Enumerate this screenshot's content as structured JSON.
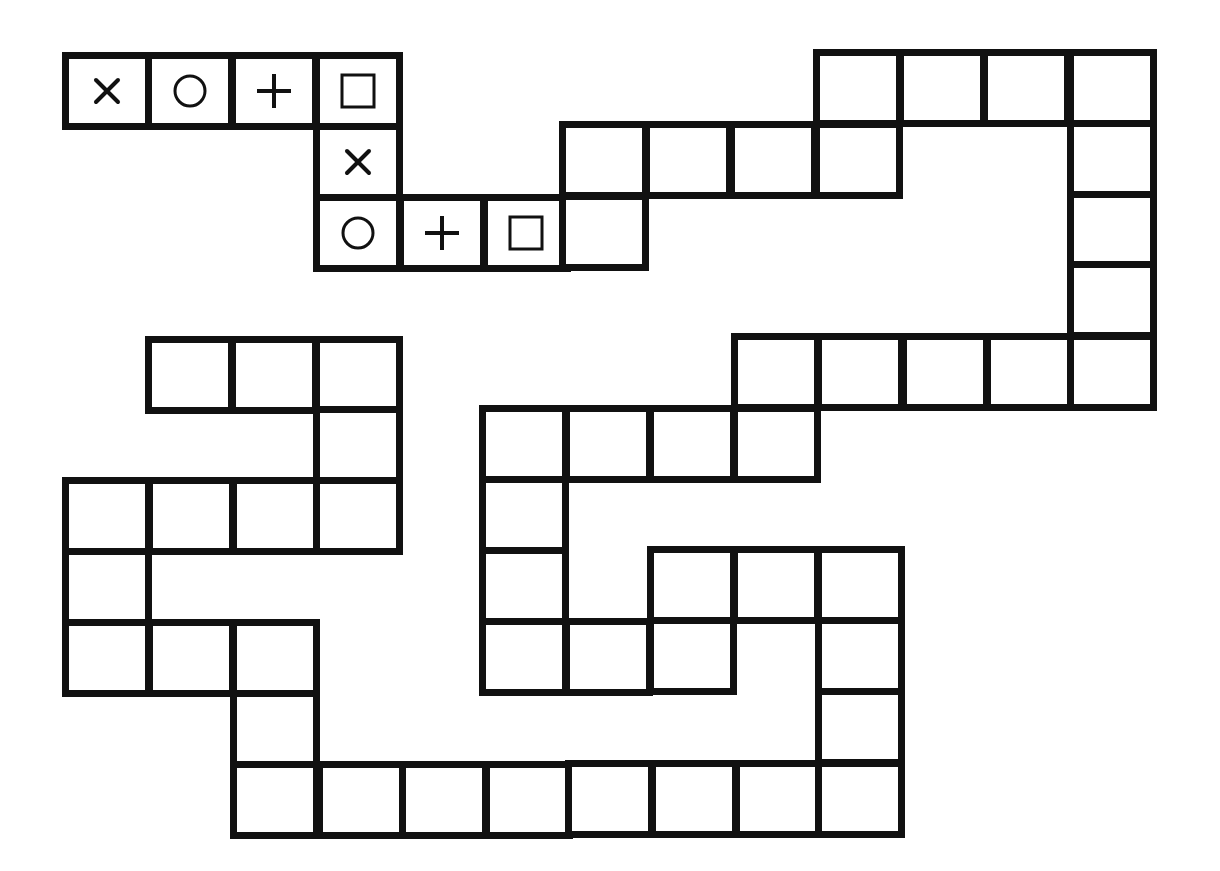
{
  "colors": {
    "line": "#111111",
    "background": "#ffffff"
  },
  "cell_size": {
    "width": 90,
    "height": 78
  },
  "symbols_legend": [
    "cross",
    "circle",
    "plus",
    "square"
  ],
  "cells": [
    {
      "x": 62,
      "y": 52,
      "symbol": "cross"
    },
    {
      "x": 145,
      "y": 52,
      "symbol": "circle"
    },
    {
      "x": 229,
      "y": 52,
      "symbol": "plus"
    },
    {
      "x": 313,
      "y": 52,
      "symbol": "square"
    },
    {
      "x": 813,
      "y": 49,
      "symbol": ""
    },
    {
      "x": 897,
      "y": 49,
      "symbol": ""
    },
    {
      "x": 981,
      "y": 49,
      "symbol": ""
    },
    {
      "x": 1067,
      "y": 49,
      "symbol": ""
    },
    {
      "x": 313,
      "y": 123,
      "symbol": "cross"
    },
    {
      "x": 559,
      "y": 121,
      "symbol": ""
    },
    {
      "x": 643,
      "y": 121,
      "symbol": ""
    },
    {
      "x": 728,
      "y": 121,
      "symbol": ""
    },
    {
      "x": 813,
      "y": 121,
      "symbol": ""
    },
    {
      "x": 1067,
      "y": 120,
      "symbol": ""
    },
    {
      "x": 313,
      "y": 194,
      "symbol": "circle"
    },
    {
      "x": 397,
      "y": 194,
      "symbol": "plus"
    },
    {
      "x": 481,
      "y": 194,
      "symbol": "square"
    },
    {
      "x": 559,
      "y": 193,
      "symbol": ""
    },
    {
      "x": 1067,
      "y": 191,
      "symbol": ""
    },
    {
      "x": 1067,
      "y": 261,
      "symbol": ""
    },
    {
      "x": 145,
      "y": 336,
      "symbol": ""
    },
    {
      "x": 229,
      "y": 336,
      "symbol": ""
    },
    {
      "x": 313,
      "y": 336,
      "symbol": ""
    },
    {
      "x": 731,
      "y": 333,
      "symbol": ""
    },
    {
      "x": 815,
      "y": 333,
      "symbol": ""
    },
    {
      "x": 900,
      "y": 333,
      "symbol": ""
    },
    {
      "x": 984,
      "y": 333,
      "symbol": ""
    },
    {
      "x": 1067,
      "y": 333,
      "symbol": ""
    },
    {
      "x": 313,
      "y": 406,
      "symbol": ""
    },
    {
      "x": 479,
      "y": 405,
      "symbol": ""
    },
    {
      "x": 563,
      "y": 405,
      "symbol": ""
    },
    {
      "x": 647,
      "y": 405,
      "symbol": ""
    },
    {
      "x": 731,
      "y": 405,
      "symbol": ""
    },
    {
      "x": 62,
      "y": 477,
      "symbol": ""
    },
    {
      "x": 146,
      "y": 477,
      "symbol": ""
    },
    {
      "x": 230,
      "y": 477,
      "symbol": ""
    },
    {
      "x": 313,
      "y": 477,
      "symbol": ""
    },
    {
      "x": 479,
      "y": 476,
      "symbol": ""
    },
    {
      "x": 62,
      "y": 548,
      "symbol": ""
    },
    {
      "x": 479,
      "y": 547,
      "symbol": ""
    },
    {
      "x": 647,
      "y": 546,
      "symbol": ""
    },
    {
      "x": 731,
      "y": 546,
      "symbol": ""
    },
    {
      "x": 815,
      "y": 546,
      "symbol": ""
    },
    {
      "x": 62,
      "y": 619,
      "symbol": ""
    },
    {
      "x": 146,
      "y": 619,
      "symbol": ""
    },
    {
      "x": 230,
      "y": 619,
      "symbol": ""
    },
    {
      "x": 479,
      "y": 618,
      "symbol": ""
    },
    {
      "x": 563,
      "y": 618,
      "symbol": ""
    },
    {
      "x": 647,
      "y": 617,
      "symbol": ""
    },
    {
      "x": 815,
      "y": 617,
      "symbol": ""
    },
    {
      "x": 230,
      "y": 690,
      "symbol": ""
    },
    {
      "x": 815,
      "y": 688,
      "symbol": ""
    },
    {
      "x": 230,
      "y": 761,
      "symbol": ""
    },
    {
      "x": 316,
      "y": 761,
      "symbol": ""
    },
    {
      "x": 399,
      "y": 761,
      "symbol": ""
    },
    {
      "x": 483,
      "y": 761,
      "symbol": ""
    },
    {
      "x": 565,
      "y": 760,
      "symbol": ""
    },
    {
      "x": 649,
      "y": 760,
      "symbol": ""
    },
    {
      "x": 733,
      "y": 760,
      "symbol": ""
    },
    {
      "x": 815,
      "y": 760,
      "symbol": ""
    }
  ]
}
